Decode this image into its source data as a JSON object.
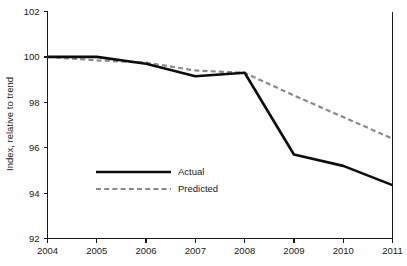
{
  "chart_data": {
    "type": "line",
    "title": "",
    "subtitle": "",
    "xlabel": "",
    "ylabel": "Index, relative to trend",
    "categories": [
      "2004",
      "2005",
      "2006",
      "2007",
      "2008",
      "2009",
      "2010",
      "2011"
    ],
    "x": [
      2004,
      2005,
      2006,
      2007,
      2008,
      2009,
      2010,
      2011
    ],
    "xlim": [
      2004,
      2011
    ],
    "ylim": [
      92,
      102
    ],
    "xticks": [
      "2004",
      "2005",
      "2006",
      "2007",
      "2008",
      "2009",
      "2010",
      "2011"
    ],
    "yticks": [
      "92",
      "94",
      "96",
      "98",
      "100",
      "102"
    ],
    "ytick_values": [
      92,
      94,
      96,
      98,
      100,
      102
    ],
    "grid": false,
    "legend_position": "center-left",
    "series": [
      {
        "name": "Actual",
        "style": "solid",
        "color": "#0d0d0d",
        "values": [
          100.0,
          100.0,
          99.7,
          99.15,
          99.3,
          95.7,
          95.2,
          94.35
        ]
      },
      {
        "name": "Predicted",
        "style": "dashed",
        "color": "#8a8a8a",
        "values": [
          100.0,
          99.85,
          99.75,
          99.4,
          99.3,
          98.3,
          97.35,
          96.4
        ]
      }
    ]
  },
  "legend": {
    "items": [
      {
        "label": "Actual"
      },
      {
        "label": "Predicted"
      }
    ]
  },
  "axes": {
    "y_title": "Index, relative to trend"
  }
}
